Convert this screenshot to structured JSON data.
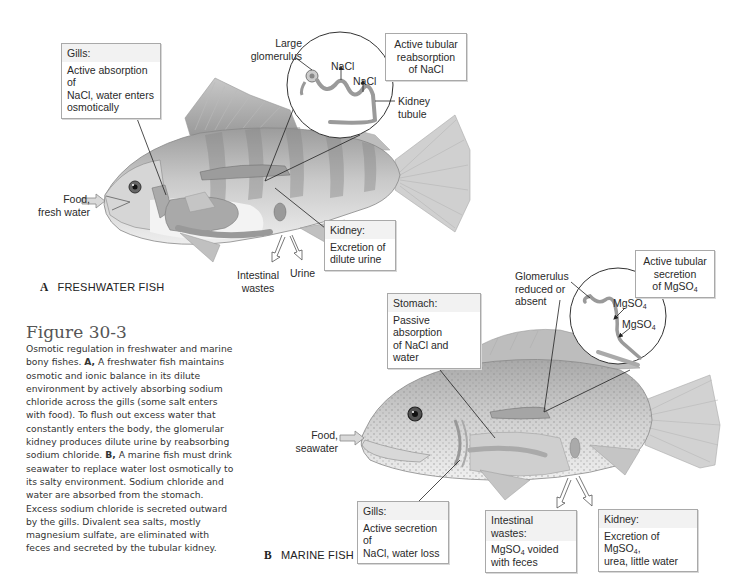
{
  "figure": {
    "title": "Figure 30-3",
    "caption_intro": "Osmotic regulation in freshwater and marine bony fishes.",
    "caption_a_marker": "A,",
    "caption_a_text": "A freshwater fish maintains osmotic and ionic balance in its dilute environment by actively absorbing sodium chloride across the gills (some salt enters with food). To flush out excess water that constantly enters the body, the glomerular kidney produces dilute urine by reabsorbing sodium chloride.",
    "caption_b_marker": "B,",
    "caption_b_text": "A marine fish must drink seawater to replace water lost osmotically to its salty environment. Sodium chloride and water are absorbed from the stomach. Excess sodium chloride is secreted outward by the gills. Divalent sea salts, mostly magnesium sulfate, are eliminated with feces and secreted by the tubular kidney."
  },
  "panel_a": {
    "letter": "A",
    "name": "FRESHWATER FISH",
    "gills_box": {
      "heading": "Gills:",
      "line1": "Active absorption of",
      "line2": "NaCl, water enters",
      "line3": "osmotically"
    },
    "kidney_box": {
      "heading": "Kidney:",
      "line1": "Excretion of",
      "line2": "dilute urine"
    },
    "tubule_box": {
      "line1": "Active tubular",
      "line2": "reabsorption",
      "line3": "of NaCl"
    },
    "glomerulus_label": {
      "line1": "Large",
      "line2": "glomerulus"
    },
    "nacl_1": "NaCl",
    "nacl_2": "NaCl",
    "kidney_tubule_label": {
      "line1": "Kidney",
      "line2": "tubule"
    },
    "food_label": {
      "line1": "Food,",
      "line2": "fresh water"
    },
    "intestinal_label": {
      "line1": "Intestinal",
      "line2": "wastes"
    },
    "urine_label": "Urine"
  },
  "panel_b": {
    "letter": "B",
    "name": "MARINE FISH",
    "stomach_box": {
      "heading": "Stomach:",
      "line1": "Passive absorption",
      "line2": "of NaCl and water"
    },
    "gills_box": {
      "heading": "Gills:",
      "line1": "Active secretion of",
      "line2": "NaCl, water loss"
    },
    "intestinal_box": {
      "heading": "Intestinal wastes:",
      "line1_pre": "MgSO",
      "line1_sub": "4",
      "line1_post": " voided",
      "line2": "with feces"
    },
    "kidney_box": {
      "heading": "Kidney:",
      "line1_pre": "Excretion of MgSO",
      "line1_sub": "4",
      "line1_post": ",",
      "line2": "urea, little water"
    },
    "tubule_box": {
      "line1": "Active tubular",
      "line2": "secretion",
      "line3_pre": "of MgSO",
      "line3_sub": "4"
    },
    "glomerulus_label": {
      "line1": "Glomerulus",
      "line2": "reduced or",
      "line3": "absent"
    },
    "mgso4_1": {
      "pre": "MgSO",
      "sub": "4"
    },
    "mgso4_2": {
      "pre": "MgSO",
      "sub": "4"
    },
    "food_label": {
      "line1": "Food,",
      "line2": "seawater"
    }
  },
  "colors": {
    "box_border": "#a9a9a9",
    "box_header": "#f2f2f2",
    "text": "#2a2a2a",
    "fish_gray": "#b5b5b5",
    "organ_gray": "#9a9a9a"
  }
}
